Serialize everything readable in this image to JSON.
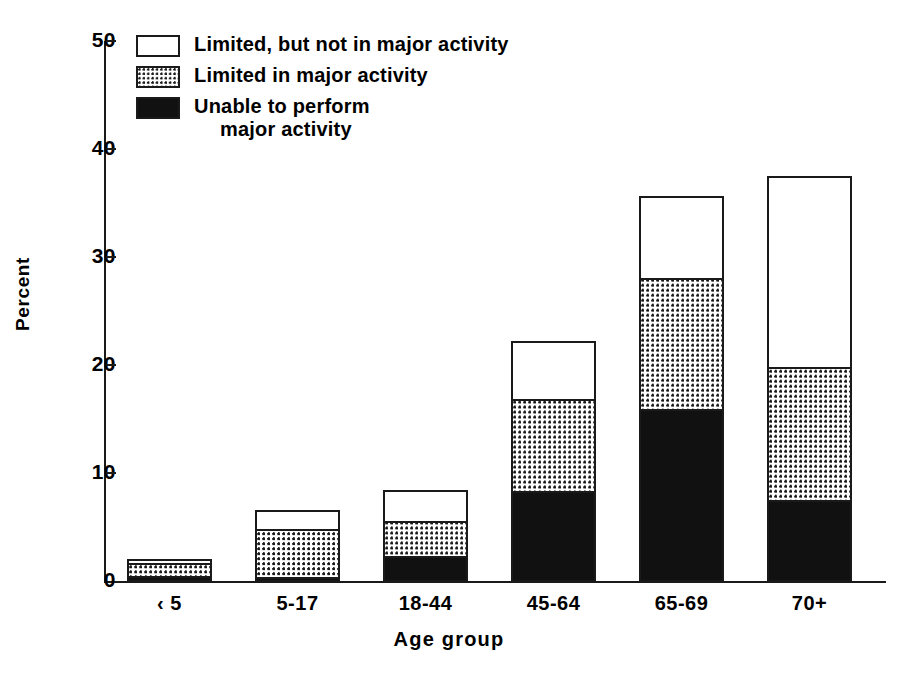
{
  "chart_data": {
    "type": "bar",
    "subtype": "stacked-bar",
    "title": "",
    "xlabel": "Age group",
    "ylabel": "Percent",
    "ylim": [
      0,
      50
    ],
    "yticks": [
      0,
      10,
      20,
      30,
      40,
      50
    ],
    "ytick_labels": [
      "0",
      "10",
      "20",
      "30",
      "40",
      "50"
    ],
    "grid": false,
    "legend_position": "top-left",
    "categories": [
      "‹ 5",
      "5-17",
      "18-44",
      "45-64",
      "65-69",
      "70+"
    ],
    "series": [
      {
        "name": "Unable to perform major activity",
        "swatch": "black",
        "values": [
          0.4,
          0.3,
          2.3,
          8.4,
          16.0,
          7.5
        ]
      },
      {
        "name": "Limited in major activity",
        "swatch": "dotted",
        "values": [
          1.4,
          4.7,
          3.4,
          8.6,
          12.2,
          12.4
        ]
      },
      {
        "name": "Limited, but not in major activity",
        "swatch": "white",
        "values": [
          0.3,
          1.7,
          2.8,
          5.3,
          7.5,
          17.7
        ]
      }
    ],
    "totals": [
      2.1,
      6.7,
      8.5,
      22.3,
      35.7,
      37.6
    ]
  },
  "legend": {
    "items": [
      {
        "label": "Limited, but not in major activity",
        "swatch": "white"
      },
      {
        "label": "Limited in major activity",
        "swatch": "dotted"
      },
      {
        "label": "Unable to perform\nmajor activity",
        "swatch": "black"
      }
    ]
  },
  "axes": {
    "y_title": "Percent",
    "x_title": "Age group",
    "y_labels": [
      "50",
      "40",
      "30",
      "20",
      "10",
      "0"
    ],
    "x_labels": [
      "‹ 5",
      "5-17",
      "18-44",
      "45-64",
      "65-69",
      "70+"
    ]
  },
  "colors": {
    "ink": "#1a1a1a",
    "fill_black": "#111111",
    "fill_white": "#ffffff",
    "background": "#ffffff"
  }
}
